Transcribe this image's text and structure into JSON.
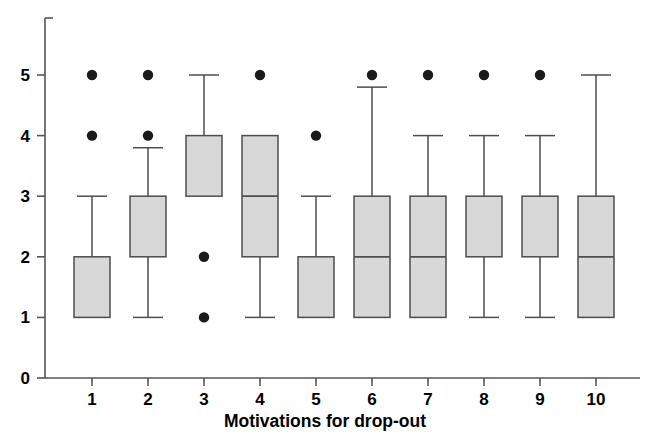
{
  "chart_data": {
    "type": "boxplot",
    "title": "",
    "xlabel": "Motivations for drop-out",
    "ylabel": "",
    "categories": [
      "1",
      "2",
      "3",
      "4",
      "5",
      "6",
      "7",
      "8",
      "9",
      "10"
    ],
    "ytick_labels": [
      "0",
      "1",
      "2",
      "3",
      "4",
      "5"
    ],
    "ytick_values": [
      0,
      1,
      2,
      3,
      4,
      5
    ],
    "ylim": [
      0,
      5.6
    ],
    "grid": false,
    "legend": null,
    "box_fill_color": "#d8d8d8",
    "box_stroke_color": "#4d4d4d",
    "whisker_color": "#4d4d4d",
    "outlier_color": "#1a1a1a",
    "axis_color": "#555555",
    "boxes": [
      {
        "category": "1",
        "whisker_low": 1,
        "q1": 1,
        "median": 1,
        "q3": 2,
        "whisker_high": 3,
        "outliers": [
          4,
          5
        ]
      },
      {
        "category": "2",
        "whisker_low": 1,
        "q1": 2,
        "median": 2,
        "q3": 3,
        "whisker_high": 3.8,
        "outliers": [
          4,
          5
        ]
      },
      {
        "category": "3",
        "whisker_low": 3,
        "q1": 3,
        "median": 3,
        "q3": 4,
        "whisker_high": 5,
        "outliers": [
          1,
          2
        ]
      },
      {
        "category": "4",
        "whisker_low": 1,
        "q1": 2,
        "median": 3,
        "q3": 4,
        "whisker_high": 4,
        "outliers": [
          5
        ]
      },
      {
        "category": "5",
        "whisker_low": 1,
        "q1": 1,
        "median": 1,
        "q3": 2,
        "whisker_high": 3,
        "outliers": [
          4
        ]
      },
      {
        "category": "6",
        "whisker_low": 1,
        "q1": 1,
        "median": 2,
        "q3": 3,
        "whisker_high": 4.8,
        "outliers": [
          5
        ]
      },
      {
        "category": "7",
        "whisker_low": 1,
        "q1": 1,
        "median": 2,
        "q3": 3,
        "whisker_high": 4,
        "outliers": [
          5
        ]
      },
      {
        "category": "8",
        "whisker_low": 1,
        "q1": 2,
        "median": 2,
        "q3": 3,
        "whisker_high": 4,
        "outliers": [
          5
        ]
      },
      {
        "category": "9",
        "whisker_low": 1,
        "q1": 2,
        "median": 2,
        "q3": 3,
        "whisker_high": 4,
        "outliers": [
          5
        ]
      },
      {
        "category": "10",
        "whisker_low": 1,
        "q1": 1,
        "median": 2,
        "q3": 3,
        "whisker_high": 5,
        "outliers": []
      }
    ]
  }
}
